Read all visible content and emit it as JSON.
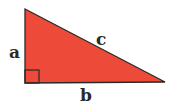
{
  "diagram": {
    "type": "right-triangle",
    "fill_color": "#ee4a3a",
    "stroke_color": "#2a2a2a",
    "labels": {
      "a": "a",
      "b": "b",
      "c": "c"
    },
    "right_angle_marker": true
  }
}
